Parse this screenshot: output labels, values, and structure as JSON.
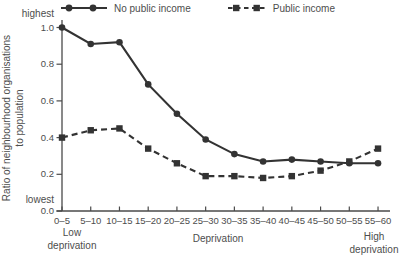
{
  "figure": {
    "background": "#ffffff",
    "line_color": "#333333",
    "axis_color": "#4a4a4a",
    "text_color": "#4d4d4d"
  },
  "legend": {
    "items": [
      {
        "label": "No public income",
        "marker": "circle",
        "line_style": "solid"
      },
      {
        "label": "Public income",
        "marker": "square",
        "line_style": "dashed"
      }
    ]
  },
  "axes": {
    "y_title_line1": "Ratio of neighbourhood organisations",
    "y_title_line2": "to population",
    "y_top_label": "highest",
    "y_bottom_label": "lowest",
    "x_title": "Deprivation",
    "x_left_line1": "Low",
    "x_left_line2": "deprivation",
    "x_right_line1": "High",
    "x_right_line2": "deprivation"
  },
  "chart_data": {
    "type": "line",
    "categories": [
      "0–5",
      "5–10",
      "10–15",
      "15–20",
      "20–25",
      "25–30",
      "30–35",
      "35–40",
      "40–45",
      "45–50",
      "50–55",
      "55–60"
    ],
    "series": [
      {
        "name": "No public income",
        "marker": "circle",
        "line_style": "solid",
        "values": [
          1.0,
          0.91,
          0.92,
          0.69,
          0.53,
          0.39,
          0.31,
          0.27,
          0.28,
          0.27,
          0.26,
          0.26
        ]
      },
      {
        "name": "Public income",
        "marker": "square",
        "line_style": "dashed",
        "values": [
          0.4,
          0.44,
          0.45,
          0.34,
          0.26,
          0.19,
          0.19,
          0.18,
          0.19,
          0.22,
          0.27,
          0.34
        ]
      }
    ],
    "title": "",
    "xlabel": "Deprivation",
    "ylabel": "Ratio of neighbourhood organisations to population",
    "ylim": [
      0.0,
      1.0
    ],
    "yticks": [
      0.0,
      0.2,
      0.4,
      0.6,
      0.8,
      1.0
    ],
    "grid": false,
    "legend_position": "top"
  }
}
